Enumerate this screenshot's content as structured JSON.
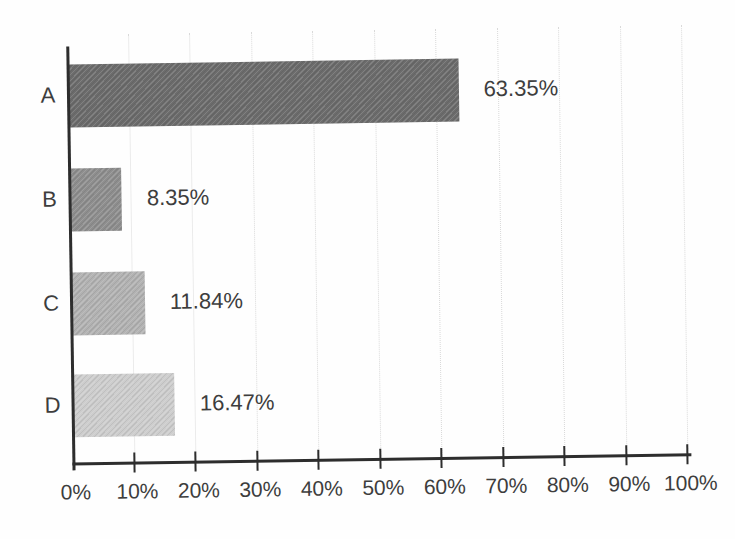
{
  "chart_data": {
    "type": "bar",
    "orientation": "horizontal",
    "title": "",
    "xlabel": "",
    "ylabel": "",
    "categories": [
      "A",
      "B",
      "C",
      "D"
    ],
    "values": [
      63.35,
      8.35,
      11.84,
      16.47
    ],
    "value_labels": [
      "63.35%",
      "8.35%",
      "11.84%",
      "16.47%"
    ],
    "bar_colors": [
      "#6c6c6c",
      "#8e8e8e",
      "#b2b2b2",
      "#cdcdcd"
    ],
    "xlim": [
      0,
      100
    ],
    "x_ticks": [
      0,
      10,
      20,
      30,
      40,
      50,
      60,
      70,
      80,
      90,
      100
    ],
    "x_tick_labels": [
      "0%",
      "10%",
      "20%",
      "30%",
      "40%",
      "50%",
      "60%",
      "70%",
      "80%",
      "90%",
      "100%"
    ],
    "grid": "vertical-faint",
    "legend": "none"
  },
  "colors": {
    "axis": "#2d2d2d",
    "text": "#3d3d3d",
    "gridline": "#d9d9d9",
    "background": "#fefefe"
  }
}
